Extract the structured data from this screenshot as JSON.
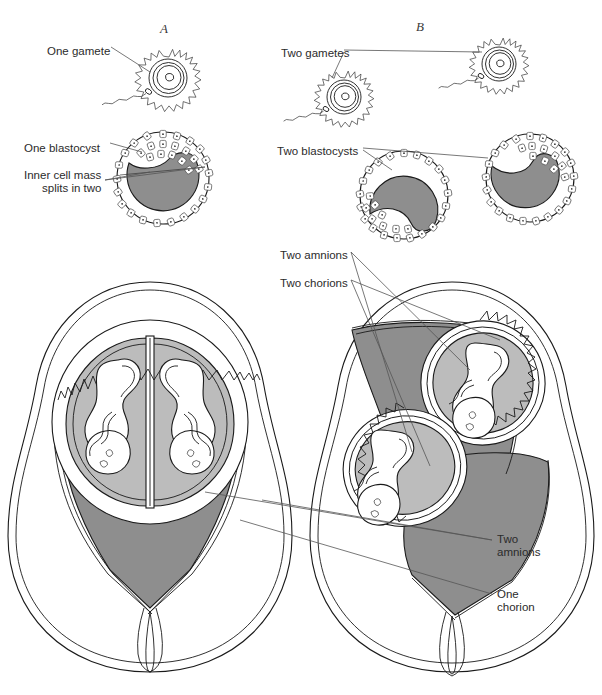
{
  "figure": {
    "panels": [
      {
        "id": "A",
        "letter": "A",
        "x": 160,
        "y": 22,
        "description": "Identical (monozygotic) twins from one gamete"
      },
      {
        "id": "B",
        "letter": "B",
        "x": 416,
        "y": 20,
        "description": "Fraternal (dizygotic) twins from two gametes"
      }
    ],
    "colors": {
      "placenta_gray": "#8e8e8e",
      "amniotic_fluid_gray": "#bcbcbc",
      "blastocyst_inner_gray": "#8e8e8e",
      "outline": "#1a1a1a",
      "leader_line": "#555555",
      "background": "#ffffff"
    },
    "labels": [
      {
        "name": "one-gamete",
        "text": "One gamete",
        "x": 47,
        "y": 45,
        "align": "left"
      },
      {
        "name": "one-blastocyst",
        "text": "One blastocyst",
        "x": 24,
        "y": 142,
        "align": "left"
      },
      {
        "name": "inner-cell-mass-line1",
        "text": "Inner cell mass",
        "x": 24,
        "y": 169,
        "align": "left"
      },
      {
        "name": "inner-cell-mass-line2",
        "text": "splits in two",
        "x": 42,
        "y": 182,
        "align": "left"
      },
      {
        "name": "two-gametes",
        "text": "Two gametes",
        "x": 281,
        "y": 47,
        "align": "left"
      },
      {
        "name": "two-blastocysts",
        "text": "Two blastocysts",
        "x": 277,
        "y": 145,
        "align": "left"
      },
      {
        "name": "two-amnions-upper",
        "text": "Two amnions",
        "x": 280,
        "y": 249,
        "align": "left"
      },
      {
        "name": "two-chorions",
        "text": "Two chorions",
        "x": 280,
        "y": 277,
        "align": "left"
      },
      {
        "name": "two-amnions-lower1",
        "text": "Two",
        "x": 497,
        "y": 533,
        "align": "left"
      },
      {
        "name": "two-amnions-lower2",
        "text": "amnions",
        "x": 497,
        "y": 546,
        "align": "left"
      },
      {
        "name": "one-chorion1",
        "text": "One",
        "x": 497,
        "y": 588,
        "align": "left"
      },
      {
        "name": "one-chorion2",
        "text": "chorion",
        "x": 497,
        "y": 601,
        "align": "left"
      }
    ],
    "structures": {
      "panel_a": {
        "ovum": "single fertilized ovum with corona radiata and sperm",
        "blastocyst": "one blastocyst with inner cell mass splitting in two",
        "uterus": "one chorion, two amnions, shared single placenta, two umbilical cords"
      },
      "panel_b": {
        "ova": "two fertilized ova each with corona radiata and sperm",
        "blastocysts": "two separate blastocysts",
        "uterus": "two chorions, two amnions, two separate placentas, two umbilical cords"
      }
    }
  }
}
